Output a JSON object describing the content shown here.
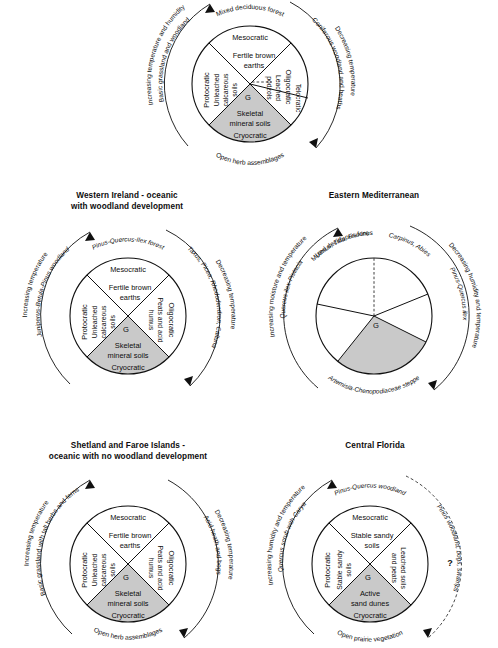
{
  "figure": {
    "type": "diagram",
    "shaded_color": "#c9c9c9",
    "line_color": "#101010"
  },
  "panels": [
    {
      "id": "generic-model",
      "title_lines": [],
      "center_marker": "G",
      "arc_top": "Mixed deciduous forest",
      "arc_bottom": "Open herb assemblages",
      "arc_left_outer": "Increasing temperature and humidity",
      "arc_left_inner": "Basic grassland and woodland",
      "arc_right_inner": "Coniferous woodland and heaths",
      "arc_right_outer": "Decreasing temperature",
      "wedges": [
        {
          "name": "Mesocratic",
          "soil": "Fertile brown earths",
          "shaded": false
        },
        {
          "name": "Protocratic",
          "soil": "Unleached calcareous soils",
          "shaded": false
        },
        {
          "name": "Oligocratic",
          "soil": "Leached podzols",
          "shaded": false
        },
        {
          "name": "Telocratic",
          "soil": "",
          "shaded": false
        },
        {
          "name": "Cryocratic",
          "soil": "Skeletal mineral soils",
          "shaded": true
        }
      ]
    },
    {
      "id": "western-ireland",
      "title_lines": [
        "Western Ireland - oceanic",
        "with woodland development"
      ],
      "center_marker": "G",
      "arc_top": "Pinus-Quercus-Ilex forest",
      "arc_bottom": "",
      "arc_left_outer": "Increasing temperature",
      "arc_left_inner": "Juniperus-Betula-Pinus woodland",
      "arc_right_inner": "Taxus, Picea, Rhododendron, Calluna",
      "arc_right_outer": "Decreasing temperature",
      "wedges": [
        {
          "name": "Mesocratic",
          "soil": "Fertile brown earths",
          "shaded": false
        },
        {
          "name": "Protocratic",
          "soil": "Unleached calcareous soils",
          "shaded": false
        },
        {
          "name": "Oligocratic",
          "soil": "Peats and acid humus",
          "shaded": false
        },
        {
          "name": "Cryocratic",
          "soil": "Skeletal mineral soils",
          "shaded": true
        }
      ]
    },
    {
      "id": "eastern-mediterranean",
      "title_lines": [
        "Eastern Mediterranean"
      ],
      "center_marker": "G",
      "arc_top_left": "Mixed deciduous forest",
      "arc_top_left_taxa": "Ulmus, Tilia, Fraxinus",
      "arc_top_right_taxa": "Carpinus, Abies",
      "arc_bottom": "Artemisia-Chenopodiaceae steppe",
      "arc_left_outer": "Increasing moisture and temperature",
      "arc_left_inner": "Quercus ilex-Pistacia",
      "arc_right_inner": "Pinus-Quercus ilex",
      "arc_right_outer": "Decreasing humidity and temperature",
      "wedges": []
    },
    {
      "id": "shetland-faroe",
      "title_lines": [
        "Shetland and Faroe Islands -",
        "oceanic with no woodland development"
      ],
      "center_marker": "G",
      "arc_top": "",
      "arc_bottom": "Open herb assemblages",
      "arc_left_outer": "Increasing temperature",
      "arc_left_inner": "Basic grassland with tall herbs and ferns",
      "arc_right_inner": "Acid heath and bogs",
      "arc_right_outer": "Decreasing temperature",
      "wedges": [
        {
          "name": "Mesocratic",
          "soil": "Fertile brown earths",
          "shaded": false
        },
        {
          "name": "Protocratic",
          "soil": "Unleached calcareous soils",
          "shaded": false
        },
        {
          "name": "Oligocratic",
          "soil": "Peats and acid humus",
          "shaded": false
        },
        {
          "name": "Cryocratic",
          "soil": "Skeletal mineral soils",
          "shaded": true
        }
      ]
    },
    {
      "id": "central-florida",
      "title_lines": [
        "Central Florida"
      ],
      "center_marker": "G",
      "arc_top": "Pinus-Quercus woodland",
      "arc_bottom": "Open prairie vegetation",
      "arc_left_outer": "Increasing humidity and temperature",
      "arc_left_inner": "Quercus scrub with Carya",
      "arc_right_inner": "Pinus woodland, bogs, swamps",
      "arc_right_outer": "",
      "uncertainty_marker": "?",
      "wedges": [
        {
          "name": "Mesocratic",
          "soil": "Stable sandy soils",
          "shaded": false
        },
        {
          "name": "Protocratic",
          "soil": "Stable sandy soils",
          "shaded": false
        },
        {
          "name": "Oligocratic",
          "soil": "Leached soils and peats",
          "shaded": false
        },
        {
          "name": "Cryocratic",
          "soil": "Active sand dunes",
          "shaded": true
        }
      ]
    }
  ]
}
